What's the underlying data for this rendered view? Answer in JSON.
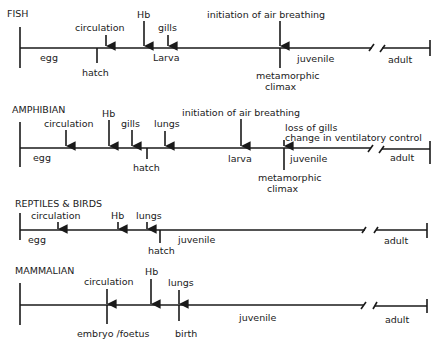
{
  "diagram": {
    "type": "developmental-timelines",
    "timelines": [
      {
        "id": "fish",
        "title": "FISH",
        "events_above": [
          {
            "label": "circulation"
          },
          {
            "label": "Hb"
          },
          {
            "label": "gills"
          },
          {
            "label": "initiation of air breathing"
          }
        ],
        "stages": [
          {
            "label": "egg"
          },
          {
            "label": "Larva"
          },
          {
            "label": "juvenile"
          },
          {
            "label": "adult"
          }
        ],
        "markers_below": [
          {
            "label": "hatch"
          },
          {
            "label": "metamorphic",
            "label2": "climax"
          }
        ]
      },
      {
        "id": "amphibian",
        "title": "AMPHIBIAN",
        "events_above": [
          {
            "label": "circulation"
          },
          {
            "label": "Hb"
          },
          {
            "label": "gills"
          },
          {
            "label": "lungs"
          },
          {
            "label": "initiation of air breathing"
          },
          {
            "label": "loss of gills",
            "label2": "change in ventilatory control"
          }
        ],
        "stages": [
          {
            "label": "egg"
          },
          {
            "label": "larva"
          },
          {
            "label": "juvenile"
          },
          {
            "label": "adult"
          }
        ],
        "markers_below": [
          {
            "label": "hatch"
          },
          {
            "label": "metamorphic",
            "label2": "climax"
          }
        ]
      },
      {
        "id": "reptiles-birds",
        "title": "REPTILES & BIRDS",
        "events_above": [
          {
            "label": "circulation"
          },
          {
            "label": "Hb"
          },
          {
            "label": "lungs"
          }
        ],
        "stages": [
          {
            "label": "egg"
          },
          {
            "label": "juvenile"
          },
          {
            "label": "adult"
          }
        ],
        "markers_below": [
          {
            "label": "hatch"
          }
        ]
      },
      {
        "id": "mammalian",
        "title": "MAMMALIAN",
        "events_above": [
          {
            "label": "circulation"
          },
          {
            "label": "Hb"
          },
          {
            "label": "lungs"
          }
        ],
        "stages": [
          {
            "label": "juvenile"
          },
          {
            "label": "adult"
          }
        ],
        "markers_below": [
          {
            "label": "embryo /foetus"
          },
          {
            "label": "birth"
          }
        ]
      }
    ]
  }
}
